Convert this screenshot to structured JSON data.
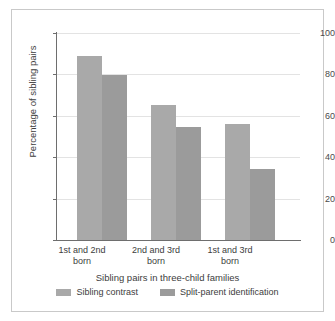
{
  "chart_data": {
    "type": "bar",
    "title": "",
    "xlabel": "Sibling pairs in three-child families",
    "ylabel": "Percentage of sibling pairs",
    "categories": [
      "1st and 2nd born",
      "2nd and 3rd born",
      "1st and 3rd born"
    ],
    "category_lines": [
      [
        "1st and 2nd",
        "born"
      ],
      [
        "2nd and 3rd",
        "born"
      ],
      [
        "1st and 3rd",
        "born"
      ]
    ],
    "series": [
      {
        "name": "Sibling contrast",
        "values": [
          89,
          65,
          56
        ],
        "color": "#a9a9a9"
      },
      {
        "name": "Split-parent identification",
        "values": [
          79.5,
          54.5,
          34.5
        ],
        "color": "#9b9b9b"
      }
    ],
    "ylim": [
      0,
      100
    ],
    "yticks": [
      0,
      20,
      40,
      60,
      80,
      100
    ],
    "ytick_labels": [
      "0",
      "20",
      "40",
      "60",
      "80",
      "100"
    ],
    "grid": true,
    "legend_position": "bottom"
  },
  "axes": {
    "y_label": "Percentage of sibling pairs",
    "x_label": "Sibling pairs in three-child families",
    "y_tick_0": "0",
    "y_tick_20": "20",
    "y_tick_40": "40",
    "y_tick_60": "60",
    "y_tick_80": "80",
    "y_tick_100": "100"
  },
  "groups": [
    {
      "line1": "1st and 2nd",
      "line2": "born"
    },
    {
      "line1": "2nd and 3rd",
      "line2": "born"
    },
    {
      "line1": "1st and 3rd",
      "line2": "born"
    }
  ],
  "legend": {
    "entries": [
      {
        "label": "Sibling contrast"
      },
      {
        "label": "Split-parent identification"
      }
    ]
  },
  "colors": {
    "series0": "#a9a9a9",
    "series1": "#9b9b9b",
    "grid": "#e3e3e3",
    "axis": "#6e6e6e",
    "border": "#c9c9c9",
    "text": "#3d3d3d",
    "background": "#ffffff"
  }
}
